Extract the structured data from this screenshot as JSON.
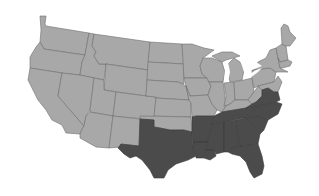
{
  "map": {
    "title": "",
    "region": "Contiguous United States",
    "colors": {
      "background": "#ffffff",
      "other_states": "#a8a8a8",
      "highlighted_states": "#4b4b4b",
      "border": "#6e6e6e"
    },
    "highlighted_states": [
      "Texas",
      "Arkansas",
      "Louisiana",
      "Mississippi",
      "Alabama",
      "Tennessee",
      "Georgia",
      "Florida",
      "South Carolina",
      "North Carolina",
      "Virginia"
    ],
    "legend": []
  }
}
